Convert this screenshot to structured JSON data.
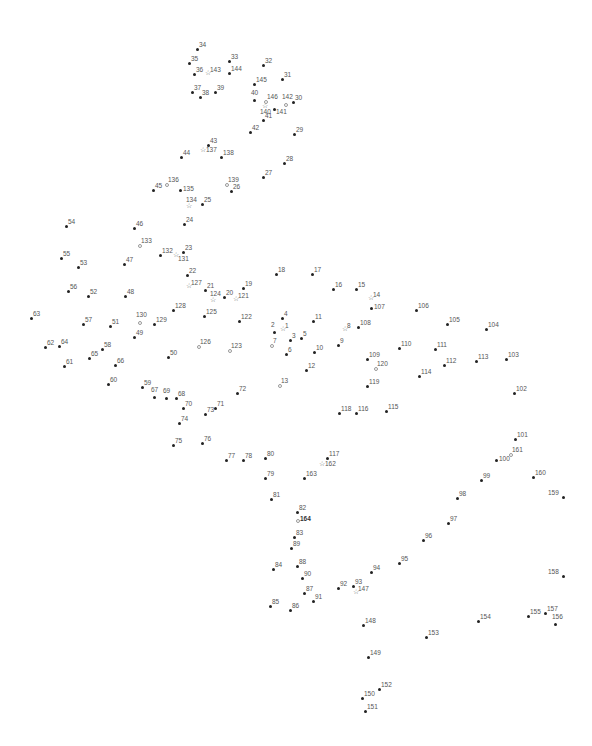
{
  "puzzle": {
    "type": "connect-the-dots",
    "point_count": 164,
    "points": [
      {
        "n": "1",
        "x": 283,
        "y": 330,
        "s": "star"
      },
      {
        "n": "2",
        "x": 274,
        "y": 332,
        "s": "dot",
        "lp": "above"
      },
      {
        "n": "3",
        "x": 290,
        "y": 340,
        "s": "dot"
      },
      {
        "n": "4",
        "x": 282,
        "y": 318,
        "s": "dot"
      },
      {
        "n": "5",
        "x": 301,
        "y": 338,
        "s": "dot"
      },
      {
        "n": "6",
        "x": 286,
        "y": 354,
        "s": "dot"
      },
      {
        "n": "7",
        "x": 271,
        "y": 345,
        "s": "hollow"
      },
      {
        "n": "8",
        "x": 345,
        "y": 330,
        "s": "star"
      },
      {
        "n": "9",
        "x": 338,
        "y": 345,
        "s": "dot"
      },
      {
        "n": "10",
        "x": 314,
        "y": 352,
        "s": "dot"
      },
      {
        "n": "11",
        "x": 313,
        "y": 321,
        "s": "dot"
      },
      {
        "n": "12",
        "x": 306,
        "y": 370,
        "s": "dot"
      },
      {
        "n": "13",
        "x": 279,
        "y": 385,
        "s": "hollow"
      },
      {
        "n": "14",
        "x": 371,
        "y": 299,
        "s": "star"
      },
      {
        "n": "15",
        "x": 356,
        "y": 289,
        "s": "dot"
      },
      {
        "n": "16",
        "x": 333,
        "y": 289,
        "s": "dot"
      },
      {
        "n": "17",
        "x": 312,
        "y": 274,
        "s": "dot"
      },
      {
        "n": "18",
        "x": 276,
        "y": 274,
        "s": "dot"
      },
      {
        "n": "19",
        "x": 243,
        "y": 288,
        "s": "dot"
      },
      {
        "n": "20",
        "x": 224,
        "y": 297,
        "s": "dot"
      },
      {
        "n": "21",
        "x": 205,
        "y": 290,
        "s": "dot"
      },
      {
        "n": "22",
        "x": 187,
        "y": 275,
        "s": "dot"
      },
      {
        "n": "23",
        "x": 183,
        "y": 252,
        "s": "dot"
      },
      {
        "n": "24",
        "x": 184,
        "y": 224,
        "s": "dot"
      },
      {
        "n": "25",
        "x": 202,
        "y": 204,
        "s": "dot"
      },
      {
        "n": "26",
        "x": 231,
        "y": 191,
        "s": "dot"
      },
      {
        "n": "27",
        "x": 263,
        "y": 177,
        "s": "dot"
      },
      {
        "n": "28",
        "x": 284,
        "y": 163,
        "s": "dot"
      },
      {
        "n": "29",
        "x": 294,
        "y": 134,
        "s": "dot"
      },
      {
        "n": "30",
        "x": 293,
        "y": 102,
        "s": "dot"
      },
      {
        "n": "31",
        "x": 282,
        "y": 79,
        "s": "dot"
      },
      {
        "n": "32",
        "x": 263,
        "y": 65,
        "s": "dot"
      },
      {
        "n": "33",
        "x": 229,
        "y": 61,
        "s": "dot"
      },
      {
        "n": "34",
        "x": 197,
        "y": 49,
        "s": "dot"
      },
      {
        "n": "35",
        "x": 189,
        "y": 63,
        "s": "dot"
      },
      {
        "n": "36",
        "x": 194,
        "y": 74,
        "s": "dot"
      },
      {
        "n": "37",
        "x": 192,
        "y": 92,
        "s": "dot"
      },
      {
        "n": "38",
        "x": 200,
        "y": 97,
        "s": "dot"
      },
      {
        "n": "39",
        "x": 215,
        "y": 92,
        "s": "dot"
      },
      {
        "n": "40",
        "x": 254,
        "y": 100,
        "s": "dot",
        "lp": "above"
      },
      {
        "n": "41",
        "x": 263,
        "y": 120,
        "s": "dot"
      },
      {
        "n": "42",
        "x": 250,
        "y": 132,
        "s": "dot"
      },
      {
        "n": "43",
        "x": 208,
        "y": 145,
        "s": "dot"
      },
      {
        "n": "44",
        "x": 181,
        "y": 157,
        "s": "dot"
      },
      {
        "n": "45",
        "x": 153,
        "y": 190,
        "s": "dot"
      },
      {
        "n": "46",
        "x": 134,
        "y": 228,
        "s": "dot"
      },
      {
        "n": "47",
        "x": 124,
        "y": 264,
        "s": "dot"
      },
      {
        "n": "48",
        "x": 125,
        "y": 296,
        "s": "dot"
      },
      {
        "n": "49",
        "x": 134,
        "y": 337,
        "s": "dot"
      },
      {
        "n": "50",
        "x": 168,
        "y": 357,
        "s": "dot"
      },
      {
        "n": "51",
        "x": 110,
        "y": 326,
        "s": "dot"
      },
      {
        "n": "52",
        "x": 88,
        "y": 296,
        "s": "dot"
      },
      {
        "n": "53",
        "x": 78,
        "y": 267,
        "s": "dot"
      },
      {
        "n": "54",
        "x": 66,
        "y": 226,
        "s": "dot"
      },
      {
        "n": "55",
        "x": 61,
        "y": 258,
        "s": "dot"
      },
      {
        "n": "56",
        "x": 68,
        "y": 291,
        "s": "dot"
      },
      {
        "n": "57",
        "x": 83,
        "y": 324,
        "s": "dot"
      },
      {
        "n": "58",
        "x": 102,
        "y": 349,
        "s": "dot"
      },
      {
        "n": "59",
        "x": 142,
        "y": 387,
        "s": "dot"
      },
      {
        "n": "60",
        "x": 108,
        "y": 384,
        "s": "dot"
      },
      {
        "n": "61",
        "x": 64,
        "y": 366,
        "s": "dot"
      },
      {
        "n": "62",
        "x": 45,
        "y": 347,
        "s": "dot"
      },
      {
        "n": "63",
        "x": 31,
        "y": 318,
        "s": "dot"
      },
      {
        "n": "64",
        "x": 59,
        "y": 346,
        "s": "dot"
      },
      {
        "n": "65",
        "x": 89,
        "y": 358,
        "s": "dot"
      },
      {
        "n": "66",
        "x": 115,
        "y": 365,
        "s": "dot"
      },
      {
        "n": "67",
        "x": 154,
        "y": 397,
        "s": "dot",
        "lp": "above"
      },
      {
        "n": "68",
        "x": 176,
        "y": 398,
        "s": "dot"
      },
      {
        "n": "69",
        "x": 166,
        "y": 398,
        "s": "dot",
        "lp": "above"
      },
      {
        "n": "70",
        "x": 183,
        "y": 408,
        "s": "dot"
      },
      {
        "n": "71",
        "x": 215,
        "y": 408,
        "s": "dot"
      },
      {
        "n": "72",
        "x": 237,
        "y": 393,
        "s": "dot"
      },
      {
        "n": "73",
        "x": 205,
        "y": 414,
        "s": "dot"
      },
      {
        "n": "74",
        "x": 179,
        "y": 423,
        "s": "dot"
      },
      {
        "n": "75",
        "x": 173,
        "y": 445,
        "s": "dot"
      },
      {
        "n": "76",
        "x": 202,
        "y": 443,
        "s": "dot"
      },
      {
        "n": "77",
        "x": 226,
        "y": 460,
        "s": "dot"
      },
      {
        "n": "78",
        "x": 243,
        "y": 460,
        "s": "dot"
      },
      {
        "n": "79",
        "x": 265,
        "y": 478,
        "s": "dot"
      },
      {
        "n": "80",
        "x": 265,
        "y": 458,
        "s": "dot"
      },
      {
        "n": "81",
        "x": 271,
        "y": 499,
        "s": "dot"
      },
      {
        "n": "82",
        "x": 297,
        "y": 512,
        "s": "dot"
      },
      {
        "n": "83",
        "x": 294,
        "y": 537,
        "s": "dot"
      },
      {
        "n": "84",
        "x": 273,
        "y": 569,
        "s": "dot"
      },
      {
        "n": "85",
        "x": 270,
        "y": 606,
        "s": "dot"
      },
      {
        "n": "86",
        "x": 290,
        "y": 610,
        "s": "dot"
      },
      {
        "n": "87",
        "x": 304,
        "y": 593,
        "s": "dot"
      },
      {
        "n": "88",
        "x": 297,
        "y": 566,
        "s": "dot"
      },
      {
        "n": "89",
        "x": 291,
        "y": 548,
        "s": "dot"
      },
      {
        "n": "90",
        "x": 302,
        "y": 578,
        "s": "dot"
      },
      {
        "n": "91",
        "x": 313,
        "y": 601,
        "s": "dot"
      },
      {
        "n": "92",
        "x": 338,
        "y": 588,
        "s": "dot"
      },
      {
        "n": "93",
        "x": 353,
        "y": 586,
        "s": "dot"
      },
      {
        "n": "94",
        "x": 371,
        "y": 572,
        "s": "dot"
      },
      {
        "n": "95",
        "x": 399,
        "y": 563,
        "s": "dot"
      },
      {
        "n": "96",
        "x": 423,
        "y": 540,
        "s": "dot"
      },
      {
        "n": "97",
        "x": 448,
        "y": 523,
        "s": "dot"
      },
      {
        "n": "98",
        "x": 457,
        "y": 498,
        "s": "dot"
      },
      {
        "n": "99",
        "x": 481,
        "y": 480,
        "s": "dot"
      },
      {
        "n": "100",
        "x": 496,
        "y": 460,
        "s": "dot",
        "lp": "right-mid"
      },
      {
        "n": "101",
        "x": 515,
        "y": 439,
        "s": "dot"
      },
      {
        "n": "102",
        "x": 514,
        "y": 393,
        "s": "dot"
      },
      {
        "n": "103",
        "x": 506,
        "y": 359,
        "s": "dot"
      },
      {
        "n": "104",
        "x": 486,
        "y": 329,
        "s": "dot"
      },
      {
        "n": "105",
        "x": 447,
        "y": 324,
        "s": "dot"
      },
      {
        "n": "106",
        "x": 416,
        "y": 310,
        "s": "dot"
      },
      {
        "n": "107",
        "x": 371,
        "y": 308,
        "s": "dot",
        "lp": "right-mid"
      },
      {
        "n": "108",
        "x": 358,
        "y": 327,
        "s": "dot"
      },
      {
        "n": "109",
        "x": 367,
        "y": 359,
        "s": "dot"
      },
      {
        "n": "110",
        "x": 399,
        "y": 348,
        "s": "dot"
      },
      {
        "n": "111",
        "x": 435,
        "y": 349,
        "s": "dot"
      },
      {
        "n": "112",
        "x": 444,
        "y": 365,
        "s": "dot"
      },
      {
        "n": "113",
        "x": 476,
        "y": 361,
        "s": "dot"
      },
      {
        "n": "114",
        "x": 419,
        "y": 376,
        "s": "dot"
      },
      {
        "n": "115",
        "x": 386,
        "y": 411,
        "s": "dot"
      },
      {
        "n": "116",
        "x": 356,
        "y": 413,
        "s": "dot"
      },
      {
        "n": "117",
        "x": 327,
        "y": 458,
        "s": "dot"
      },
      {
        "n": "118",
        "x": 339,
        "y": 413,
        "s": "dot"
      },
      {
        "n": "119",
        "x": 367,
        "y": 386,
        "s": "dot"
      },
      {
        "n": "120",
        "x": 375,
        "y": 368,
        "s": "hollow"
      },
      {
        "n": "121",
        "x": 236,
        "y": 300,
        "s": "star"
      },
      {
        "n": "122",
        "x": 239,
        "y": 321,
        "s": "dot"
      },
      {
        "n": "123",
        "x": 229,
        "y": 350,
        "s": "hollow"
      },
      {
        "n": "124",
        "x": 213,
        "y": 301,
        "s": "star",
        "lp": "above"
      },
      {
        "n": "125",
        "x": 204,
        "y": 316,
        "s": "dot"
      },
      {
        "n": "126",
        "x": 198,
        "y": 346,
        "s": "hollow"
      },
      {
        "n": "127",
        "x": 189,
        "y": 287,
        "s": "star"
      },
      {
        "n": "128",
        "x": 173,
        "y": 310,
        "s": "dot"
      },
      {
        "n": "129",
        "x": 154,
        "y": 324,
        "s": "dot"
      },
      {
        "n": "130",
        "x": 139,
        "y": 322,
        "s": "hollow",
        "lp": "above"
      },
      {
        "n": "131",
        "x": 176,
        "y": 256,
        "s": "star",
        "lp": "below-right"
      },
      {
        "n": "132",
        "x": 160,
        "y": 255,
        "s": "dot"
      },
      {
        "n": "133",
        "x": 139,
        "y": 245,
        "s": "hollow"
      },
      {
        "n": "134",
        "x": 189,
        "y": 207,
        "s": "star",
        "lp": "above"
      },
      {
        "n": "135",
        "x": 180,
        "y": 190,
        "s": "dot",
        "lp": "right-mid"
      },
      {
        "n": "136",
        "x": 166,
        "y": 184,
        "s": "hollow"
      },
      {
        "n": "137",
        "x": 203,
        "y": 151,
        "s": "star",
        "lp": "right-mid"
      },
      {
        "n": "138",
        "x": 221,
        "y": 157,
        "s": "dot"
      },
      {
        "n": "139",
        "x": 226,
        "y": 184,
        "s": "hollow"
      },
      {
        "n": "140",
        "x": 265,
        "y": 107,
        "s": "star",
        "lp": "below"
      },
      {
        "n": "141",
        "x": 274,
        "y": 109,
        "s": "dot",
        "lp": "below-right"
      },
      {
        "n": "142",
        "x": 285,
        "y": 104,
        "s": "hollow",
        "lp": "above"
      },
      {
        "n": "143",
        "x": 208,
        "y": 74,
        "s": "star"
      },
      {
        "n": "144",
        "x": 229,
        "y": 73,
        "s": "dot"
      },
      {
        "n": "145",
        "x": 254,
        "y": 84,
        "s": "dot"
      },
      {
        "n": "146",
        "x": 265,
        "y": 101,
        "s": "hollow"
      },
      {
        "n": "147",
        "x": 356,
        "y": 593,
        "s": "star"
      },
      {
        "n": "148",
        "x": 363,
        "y": 625,
        "s": "dot"
      },
      {
        "n": "149",
        "x": 368,
        "y": 657,
        "s": "dot"
      },
      {
        "n": "150",
        "x": 362,
        "y": 698,
        "s": "dot"
      },
      {
        "n": "151",
        "x": 365,
        "y": 711,
        "s": "dot"
      },
      {
        "n": "152",
        "x": 379,
        "y": 689,
        "s": "dot"
      },
      {
        "n": "153",
        "x": 426,
        "y": 637,
        "s": "dot"
      },
      {
        "n": "154",
        "x": 478,
        "y": 621,
        "s": "dot"
      },
      {
        "n": "155",
        "x": 528,
        "y": 616,
        "s": "dot"
      },
      {
        "n": "156",
        "x": 555,
        "y": 624,
        "s": "dot",
        "lp": "above"
      },
      {
        "n": "157",
        "x": 545,
        "y": 613,
        "s": "dot"
      },
      {
        "n": "158",
        "x": 563,
        "y": 576,
        "s": "dot",
        "lp": "left-above"
      },
      {
        "n": "159",
        "x": 563,
        "y": 497,
        "s": "dot",
        "lp": "left-above"
      },
      {
        "n": "160",
        "x": 533,
        "y": 477,
        "s": "dot"
      },
      {
        "n": "161",
        "x": 510,
        "y": 454,
        "s": "hollow"
      },
      {
        "n": "162",
        "x": 322,
        "y": 465,
        "s": "star",
        "lp": "right-mid"
      },
      {
        "n": "163",
        "x": 304,
        "y": 478,
        "s": "dot"
      },
      {
        "n": "164",
        "x": 297,
        "y": 520,
        "s": "hollow",
        "lp": "right-mid",
        "bold": true
      }
    ]
  }
}
